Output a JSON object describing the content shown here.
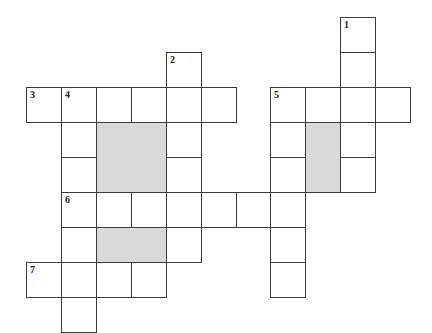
{
  "puzzle": {
    "type": "crossword",
    "cell_size": 35,
    "colors": {
      "white_cell": "#ffffff",
      "shaded_cell": "#d9d9d9",
      "line": "#3a3a3a"
    },
    "clue_numbers": [
      "1",
      "2",
      "3",
      "4",
      "5",
      "6",
      "7"
    ],
    "cells": [
      {
        "x": 340,
        "y": 17,
        "num": "1"
      },
      {
        "x": 340,
        "y": 52
      },
      {
        "x": 166,
        "y": 52,
        "num": "2"
      },
      {
        "x": 26,
        "y": 87,
        "num": "3"
      },
      {
        "x": 61,
        "y": 87,
        "num": "4"
      },
      {
        "x": 96,
        "y": 87
      },
      {
        "x": 131,
        "y": 87
      },
      {
        "x": 166,
        "y": 87
      },
      {
        "x": 201,
        "y": 87
      },
      {
        "x": 270,
        "y": 87,
        "num": "5"
      },
      {
        "x": 305,
        "y": 87
      },
      {
        "x": 340,
        "y": 87
      },
      {
        "x": 375,
        "y": 87
      },
      {
        "x": 61,
        "y": 122
      },
      {
        "x": 166,
        "y": 122
      },
      {
        "x": 270,
        "y": 122
      },
      {
        "x": 340,
        "y": 122
      },
      {
        "x": 61,
        "y": 157
      },
      {
        "x": 166,
        "y": 157
      },
      {
        "x": 270,
        "y": 157
      },
      {
        "x": 340,
        "y": 157
      },
      {
        "x": 61,
        "y": 192,
        "num": "6"
      },
      {
        "x": 96,
        "y": 192
      },
      {
        "x": 131,
        "y": 192
      },
      {
        "x": 166,
        "y": 192
      },
      {
        "x": 201,
        "y": 192
      },
      {
        "x": 236,
        "y": 192
      },
      {
        "x": 270,
        "y": 192
      },
      {
        "x": 61,
        "y": 227
      },
      {
        "x": 166,
        "y": 227
      },
      {
        "x": 270,
        "y": 227
      },
      {
        "x": 26,
        "y": 262,
        "num": "7"
      },
      {
        "x": 61,
        "y": 262
      },
      {
        "x": 96,
        "y": 262
      },
      {
        "x": 131,
        "y": 262
      },
      {
        "x": 270,
        "y": 262
      },
      {
        "x": 61,
        "y": 297
      }
    ],
    "shaded_blocks": [
      {
        "x": 96,
        "y": 122,
        "w": 70,
        "h": 70
      },
      {
        "x": 305,
        "y": 122,
        "w": 35,
        "h": 70
      },
      {
        "x": 96,
        "y": 227,
        "w": 70,
        "h": 35
      }
    ],
    "entries": {
      "across": [
        {
          "num": "3",
          "length": 6
        },
        {
          "num": "5",
          "length": 4
        },
        {
          "num": "6",
          "length": 7
        },
        {
          "num": "7",
          "length": 4
        }
      ],
      "down": [
        {
          "num": "1",
          "length": 5
        },
        {
          "num": "2",
          "length": 6
        },
        {
          "num": "4",
          "length": 7
        },
        {
          "num": "5",
          "length": 6
        }
      ]
    }
  }
}
